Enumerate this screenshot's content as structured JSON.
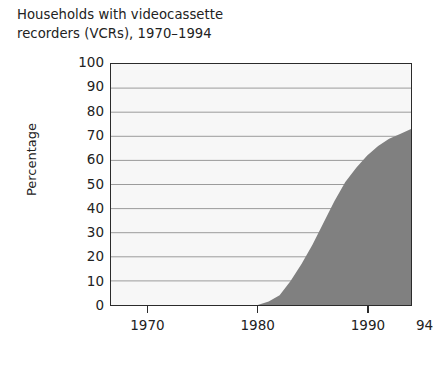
{
  "chart_data": {
    "type": "area",
    "title": "Households with videocassette\nrecorders (VCRs), 1970–1994",
    "xlabel": "",
    "ylabel": "Percentage",
    "ylim": [
      0,
      100
    ],
    "xlim": [
      1966.6,
      1994
    ],
    "grid": true,
    "legend_position": "none",
    "y_ticks": [
      100,
      90,
      80,
      70,
      60,
      50,
      40,
      30,
      20,
      10,
      0
    ],
    "x_ticks": [
      {
        "value": 1970,
        "label": "1970"
      },
      {
        "value": 1980,
        "label": "1980"
      },
      {
        "value": 1990,
        "label": "1990"
      },
      {
        "value": 1994,
        "label": "94"
      }
    ],
    "x": [
      1970,
      1971,
      1972,
      1973,
      1974,
      1975,
      1976,
      1977,
      1978,
      1979,
      1980,
      1981,
      1982,
      1983,
      1984,
      1985,
      1986,
      1987,
      1988,
      1989,
      1990,
      1991,
      1992,
      1993,
      1994
    ],
    "values": [
      0,
      0,
      0,
      0,
      0,
      0,
      0,
      0,
      0,
      0,
      0,
      1.5,
      4,
      10,
      17,
      25,
      34,
      43,
      51,
      57,
      62,
      66,
      69,
      71,
      73
    ],
    "series": [
      {
        "name": "Percentage of households with VCRs",
        "values": [
          0,
          0,
          0,
          0,
          0,
          0,
          0,
          0,
          0,
          0,
          0,
          1.5,
          4,
          10,
          17,
          25,
          34,
          43,
          51,
          57,
          62,
          66,
          69,
          71,
          73
        ]
      }
    ],
    "colors": {
      "area_fill": "#808080",
      "plot_background": "#f7f7f7",
      "gridline": "#9a9a9a",
      "axis": "#2b2b2b",
      "text": "#222222"
    }
  }
}
